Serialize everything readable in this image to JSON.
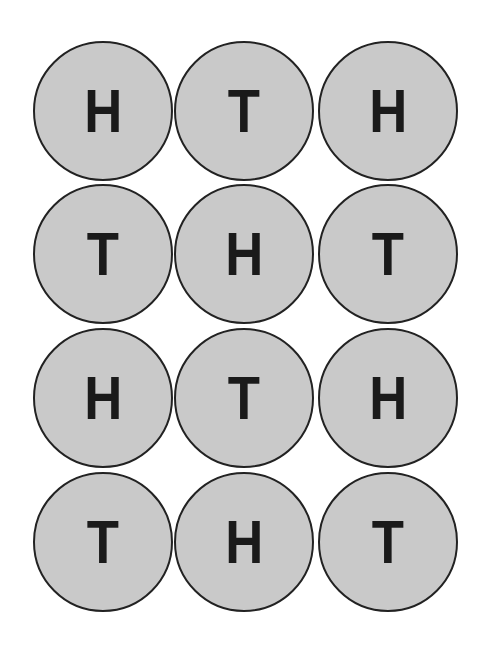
{
  "grid": {
    "rows": [
      [
        "H",
        "T",
        "H"
      ],
      [
        "T",
        "H",
        "T"
      ],
      [
        "H",
        "T",
        "H"
      ],
      [
        "T",
        "H",
        "T"
      ]
    ]
  },
  "colors": {
    "coin_fill": "#c9c9c9",
    "coin_border": "#222222",
    "letter": "#1a1a1a"
  }
}
